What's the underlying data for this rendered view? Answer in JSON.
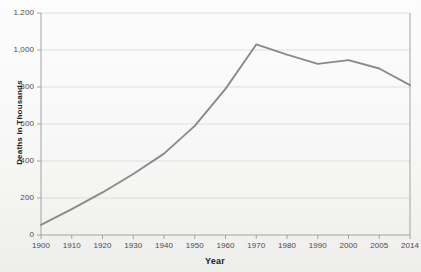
{
  "chart_data": {
    "type": "line",
    "title": "",
    "xlabel": "Year",
    "ylabel": "Deaths in Thousands",
    "x": [
      1900,
      1910,
      1920,
      1930,
      1940,
      1950,
      1960,
      1970,
      1980,
      1990,
      2000,
      2005,
      2014
    ],
    "categories": [
      "1900",
      "1910",
      "1920",
      "1930",
      "1940",
      "1950",
      "1960",
      "1970",
      "1980",
      "1990",
      "2000",
      "2005",
      "2014"
    ],
    "values": [
      55,
      140,
      230,
      330,
      440,
      590,
      790,
      1030,
      975,
      925,
      945,
      900,
      810
    ],
    "series": [
      {
        "name": "Deaths in Thousands",
        "values": [
          55,
          140,
          230,
          330,
          440,
          590,
          790,
          1030,
          975,
          925,
          945,
          900,
          810
        ]
      }
    ],
    "ylim": [
      0,
      1200
    ],
    "ytick_labels": [
      "0",
      "200",
      "400",
      "600",
      "800",
      "1,000",
      "1.200"
    ],
    "ytick_values": [
      0,
      200,
      400,
      600,
      800,
      1000,
      1200
    ],
    "grid": true,
    "legend": "none",
    "line_color": "#8a8a8a",
    "grid_color": "#d9d9d9",
    "axis_color": "#9a9a9a",
    "text_color": "#4a4a4a",
    "title_color": "#222222"
  }
}
